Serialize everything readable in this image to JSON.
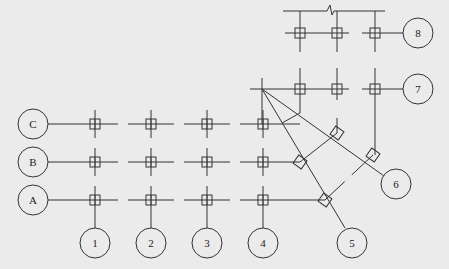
{
  "diagram": {
    "title": "",
    "type": "structural-axis-grid-plan",
    "colors": {
      "background": "#ebebeb",
      "line": "#333333"
    },
    "row_axes": [
      {
        "label": "C",
        "x": 33,
        "y": 124
      },
      {
        "label": "B",
        "x": 33,
        "y": 162
      },
      {
        "label": "A",
        "x": 33,
        "y": 200
      }
    ],
    "column_axes": [
      {
        "label": "1",
        "x": 95,
        "y": 243
      },
      {
        "label": "2",
        "x": 151,
        "y": 243
      },
      {
        "label": "3",
        "x": 207,
        "y": 243
      },
      {
        "label": "4",
        "x": 263,
        "y": 243
      },
      {
        "label": "5",
        "x": 352,
        "y": 243
      },
      {
        "label": "6",
        "x": 396,
        "y": 184
      }
    ],
    "upper_row_axes": [
      {
        "label": "8",
        "x": 418,
        "y": 33
      },
      {
        "label": "7",
        "x": 418,
        "y": 89
      }
    ],
    "columns_note": "square column symbols at grid intersections; rotated squares on skewed axes 5 and 6"
  }
}
